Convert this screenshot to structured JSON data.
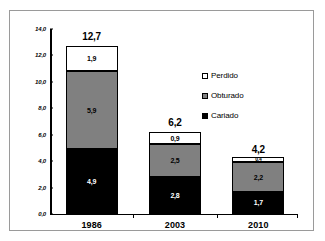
{
  "chart_data": {
    "type": "bar",
    "subtype": "stacked-bar",
    "title": "",
    "xlabel": "",
    "ylabel": "",
    "categories": [
      "1986",
      "2003",
      "2010"
    ],
    "series": [
      {
        "name": "Cariado",
        "color": "#000000",
        "values": [
          4.9,
          2.8,
          1.7
        ],
        "labels": [
          "4,9",
          "2,8",
          "1,7"
        ]
      },
      {
        "name": "Obturado",
        "color": "#808080",
        "values": [
          5.9,
          2.5,
          2.2
        ],
        "labels": [
          "5,9",
          "2,5",
          "2,2"
        ]
      },
      {
        "name": "Perdido",
        "color": "#FFFFFF",
        "values": [
          1.9,
          0.9,
          0.4
        ],
        "labels": [
          "1,9",
          "0,9",
          "0,4"
        ]
      }
    ],
    "totals": [
      12.7,
      6.2,
      4.2
    ],
    "total_labels": [
      "12,7",
      "6,2",
      "4,2"
    ],
    "ylim": [
      0,
      14
    ],
    "ytick_values": [
      0,
      2,
      4,
      6,
      8,
      10,
      12,
      14
    ],
    "ytick_labels": [
      "0,0",
      "2,0",
      "4,0",
      "6,0",
      "8,0",
      "10,0",
      "12,0",
      "14,0"
    ],
    "grid": false,
    "legend_position": "inside-upper-center",
    "legend_order": [
      "Perdido",
      "Obturado",
      "Cariado"
    ],
    "decimal_separator": ","
  },
  "legend": {
    "items": [
      {
        "label": "Perdido",
        "swatch": "white-square-icon"
      },
      {
        "label": "Obturado",
        "swatch": "gray-square-icon"
      },
      {
        "label": "Cariado",
        "swatch": "black-square-icon"
      }
    ]
  }
}
